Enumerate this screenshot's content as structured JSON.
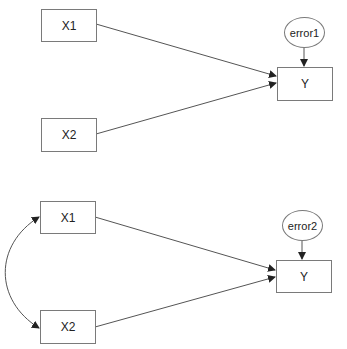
{
  "diagrams": [
    {
      "name": "model-1",
      "predictors": [
        "X1",
        "X2"
      ],
      "outcome": "Y",
      "error": "error1",
      "covariance": false
    },
    {
      "name": "model-2",
      "predictors": [
        "X1",
        "X2"
      ],
      "outcome": "Y",
      "error": "error2",
      "covariance": true
    }
  ],
  "colors": {
    "line": "#555555",
    "border": "#7a7a7a",
    "text": "#222222"
  }
}
